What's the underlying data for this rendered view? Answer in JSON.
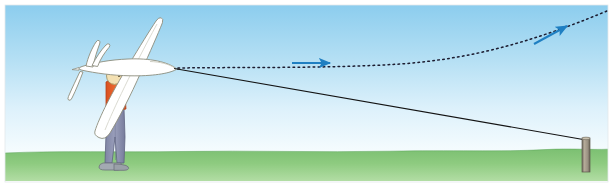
{
  "illustration": {
    "title": "Bungee (hi-start) launch of a hand-held glider",
    "caption": "",
    "width": 613,
    "height": 187
  },
  "colors": {
    "sky_top": "#8ccdee",
    "sky_mid": "#bfe3f5",
    "sky_bottom": "#f2fbfe",
    "ground_top": "#76bd6e",
    "ground_bottom": "#a7d89a",
    "ground_edge": "#3e8a47",
    "arrow_blue": "#1f7fc2",
    "trajectory": "#1a1a2e",
    "tow_line": "#111111",
    "glider_body": "#ffffff",
    "glider_outline": "#7a7a6a",
    "shirt": "#e8602c",
    "trousers": "#8b8fae",
    "skin": "#f2dfb0",
    "hair": "#e8dcae",
    "shoe": "#9aa0a8",
    "post_body": "#9b9283",
    "post_shade": "#6f6a5e",
    "frame": "#ffffff"
  },
  "scene_elements": {
    "sky_label": "sky",
    "ground_label": "grass field",
    "person_label": "person launching glider",
    "glider_label": "glider held vertically by the wing",
    "tow_line_label": "bungee tow line to ground anchor",
    "trajectory_label": "dotted flight path of glider",
    "post_label": "ground anchor stake",
    "arrow_mid_label": "direction of travel arrow",
    "arrow_top_label": "climb direction arrow"
  },
  "geometry": {
    "nose": {
      "x": 176,
      "y": 68
    },
    "anchor_post": {
      "x": 586,
      "y": 138,
      "bottom_y": 172
    },
    "trajectory_end": {
      "x": 607,
      "y": 11
    },
    "arrow_mid": {
      "x1": 292,
      "y1": 63,
      "x2": 332,
      "y2": 63
    },
    "arrow_top": {
      "x1": 535,
      "y1": 44,
      "x2": 570,
      "y2": 25
    },
    "horizon_y": 152
  }
}
